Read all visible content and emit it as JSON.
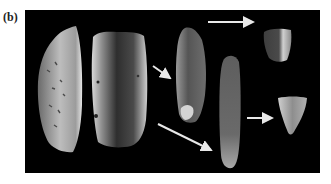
{
  "figure": {
    "label": "(b)",
    "panel_background": "#000000",
    "page_background": "#ffffff",
    "artifacts": [
      {
        "id": "flake-large",
        "name": "large cortical flake",
        "tone": "#b8b8b8"
      },
      {
        "id": "blade-core",
        "name": "blade core",
        "tone": "#8a8a8a"
      },
      {
        "id": "blade-elongated",
        "name": "elongated blade",
        "tone": "#6e6e6e"
      },
      {
        "id": "blade-long",
        "name": "long narrow blade",
        "tone": "#7a7a7a"
      },
      {
        "id": "tool-small-top",
        "name": "small retouched tool (top)",
        "tone": "#5a5a5a"
      },
      {
        "id": "tool-small-bottom",
        "name": "small retouched tool (bottom)",
        "tone": "#9a9a9a"
      }
    ],
    "arrows": [
      {
        "id": "arrow-core-to-blade",
        "from": "blade-core",
        "to": "blade-elongated"
      },
      {
        "id": "arrow-core-to-longblade",
        "from": "blade-core",
        "to": "blade-long"
      },
      {
        "id": "arrow-blade-to-tool-top",
        "from": "blade-elongated",
        "to": "tool-small-top"
      },
      {
        "id": "arrow-longblade-to-tool-bottom",
        "from": "blade-long",
        "to": "tool-small-bottom"
      }
    ],
    "arrow_color": "#e8e8e8"
  }
}
